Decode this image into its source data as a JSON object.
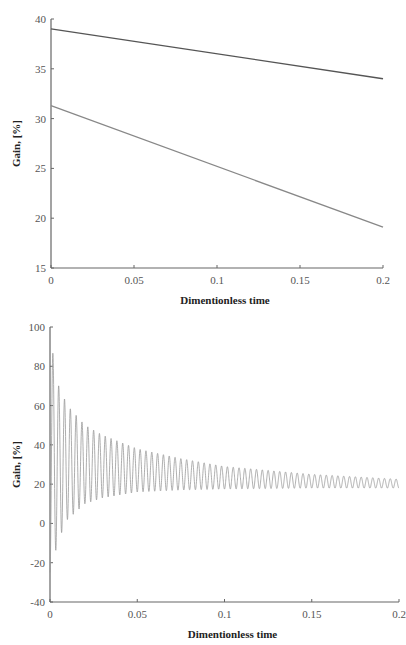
{
  "chart_data": [
    {
      "type": "line",
      "title": "",
      "xlabel": "Dimentionless time",
      "ylabel": "Gain, [%]",
      "xlim": [
        0,
        0.2
      ],
      "ylim": [
        15,
        40
      ],
      "xticks": [
        "0",
        "0.05",
        "0.1",
        "0.15",
        "0.2"
      ],
      "yticks": [
        "15",
        "20",
        "25",
        "30",
        "35",
        "40"
      ],
      "grid": false,
      "legend": null,
      "series": [
        {
          "name": "upper line",
          "color": "#555555",
          "x": [
            0,
            0.2
          ],
          "values": [
            39.0,
            34.0
          ]
        },
        {
          "name": "lower line",
          "color": "#888888",
          "x": [
            0,
            0.2
          ],
          "values": [
            31.3,
            19.1
          ]
        }
      ]
    },
    {
      "type": "line",
      "title": "",
      "xlabel": "Dimentionless time",
      "ylabel": "Gain, [%]",
      "xlim": [
        0,
        0.2
      ],
      "ylim": [
        -40,
        100
      ],
      "xticks": [
        "0",
        "0.05",
        "0.1",
        "0.15",
        "0.2"
      ],
      "yticks": [
        "-40",
        "-20",
        "0",
        "20",
        "40",
        "60",
        "80",
        "100"
      ],
      "grid": false,
      "legend": null,
      "series": [
        {
          "name": "damped oscillation",
          "color": "#999999",
          "description": "Damped oscillation starting near -25, first peak ~95, decaying toward a mean of ~20",
          "mean": 20,
          "cycles": 60,
          "envelope_x": [
            0,
            0.005,
            0.01,
            0.02,
            0.03,
            0.05,
            0.075,
            0.1,
            0.15,
            0.2
          ],
          "peaks": [
            95,
            70,
            60,
            50,
            45,
            38,
            33,
            29,
            25,
            22.5
          ],
          "troughs": [
            -25,
            -8,
            2,
            10,
            13,
            16,
            17,
            17.5,
            18,
            18
          ]
        }
      ]
    }
  ]
}
